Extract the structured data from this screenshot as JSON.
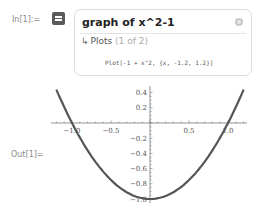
{
  "input": {
    "label": "In[1]:=",
    "query": "graph of x^2-1",
    "pod_title": "Plots",
    "pod_count": "(1 of 2)",
    "code": "Plot[-1 + x^2, {x, -1.2, 1.2}]"
  },
  "output": {
    "label": "Out[1]="
  },
  "icons": {
    "input_mode": "wolfram-alpha-icon",
    "close": "close-circle-icon",
    "arrow": "return-arrow-icon"
  },
  "chart_data": {
    "type": "line",
    "title": "",
    "function": "x^2 - 1",
    "x": [
      -1.2,
      -1.0,
      -0.8,
      -0.6,
      -0.4,
      -0.2,
      0.0,
      0.2,
      0.4,
      0.6,
      0.8,
      1.0,
      1.2
    ],
    "series": [
      {
        "name": "x^2-1",
        "values": [
          0.44,
          0.0,
          -0.36,
          -0.64,
          -0.84,
          -0.96,
          -1.0,
          -0.96,
          -0.84,
          -0.64,
          -0.36,
          0.0,
          0.44
        ]
      }
    ],
    "xlim": [
      -1.2,
      1.2
    ],
    "ylim": [
      -1.0,
      0.44
    ],
    "x_ticks": [
      "-1.0",
      "-0.5",
      "0.5",
      "1.0"
    ],
    "y_ticks": [
      "0.4",
      "0.2",
      "-0.2",
      "-0.4",
      "-0.6",
      "-0.8",
      "-1.0"
    ],
    "grid": false,
    "axes_origin": [
      0,
      0
    ]
  }
}
